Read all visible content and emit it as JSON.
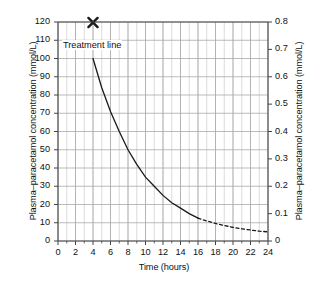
{
  "chart_data": {
    "type": "line",
    "title": "",
    "xlabel": "Time (hours)",
    "ylabel": "Plasma–paracetamol concentration (mmol/L)",
    "ylabel_right": "Plasma–paracetamol concentration (mmol/L)",
    "xlim": [
      0,
      24
    ],
    "ylim": [
      0,
      120
    ],
    "ylim_right": [
      0,
      0.8
    ],
    "grid": true,
    "legend_position": "none",
    "x_ticks": [
      0,
      2,
      4,
      6,
      8,
      10,
      12,
      14,
      16,
      18,
      20,
      22,
      24
    ],
    "x_tick_labels": [
      "0",
      "2",
      "4",
      "6",
      "8",
      "10",
      "12",
      "14",
      "16",
      "18",
      "20",
      "22",
      "24"
    ],
    "x_minor_step": 1,
    "y_ticks_left": [
      0,
      10,
      20,
      30,
      40,
      50,
      60,
      70,
      80,
      90,
      100,
      110,
      120
    ],
    "y_tick_labels_left": [
      "0",
      "10",
      "20",
      "30",
      "40",
      "50",
      "60",
      "70",
      "80",
      "90",
      "100",
      "110",
      "120"
    ],
    "y_ticks_right": [
      0,
      0.1,
      0.2,
      0.3,
      0.4,
      0.5,
      0.6,
      0.7,
      0.8
    ],
    "y_tick_labels_right": [
      "0",
      "0.1",
      "0.2",
      "0.3",
      "0.4",
      "0.5",
      "0.6",
      "0.7",
      "0.8"
    ],
    "series": [
      {
        "name": "Treatment line",
        "style": "solid",
        "color": "#1a1a1a",
        "x": [
          4,
          5,
          6,
          7,
          8,
          9,
          10,
          11,
          12,
          13,
          14,
          15,
          16
        ],
        "values": [
          100,
          84,
          71,
          60,
          50,
          42,
          35,
          30,
          25,
          21,
          18,
          15,
          12.5
        ]
      },
      {
        "name": "Treatment line (extrapolated)",
        "style": "dashed",
        "color": "#1a1a1a",
        "x": [
          16,
          17,
          18,
          19,
          20,
          21,
          22,
          23,
          24
        ],
        "values": [
          12.5,
          11,
          9.6,
          8.5,
          7.5,
          6.7,
          6,
          5.4,
          5
        ]
      }
    ],
    "annotations": [
      {
        "name": "treatment-line-label",
        "text": "Treatment line",
        "x": 4.2,
        "y": 113
      },
      {
        "name": "x-marker",
        "text": "×",
        "marker": "X",
        "x": 4,
        "y": 120
      }
    ]
  },
  "colors": {
    "curve": "#1a1a1a",
    "grid_major": "#aaaaaa",
    "grid_minor": "#cccccc",
    "axis": "#444444",
    "text": "#111111",
    "background": "#ffffff"
  }
}
